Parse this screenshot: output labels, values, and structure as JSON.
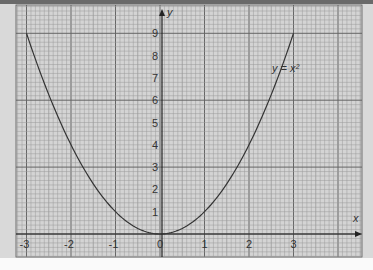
{
  "chart_data": {
    "type": "line",
    "title": "",
    "xlabel": "x",
    "ylabel": "y",
    "xlim": [
      -3.2,
      4.5
    ],
    "ylim": [
      -1,
      10
    ],
    "grid": true,
    "x_ticks": [
      "-3",
      "-2",
      "-1",
      "0",
      "1",
      "2",
      "3"
    ],
    "y_ticks": [
      "1",
      "2",
      "3",
      "4",
      "5",
      "6",
      "7",
      "8",
      "9"
    ],
    "series": [
      {
        "name": "y = x²",
        "x": [
          -3,
          -2.5,
          -2,
          -1.5,
          -1,
          -0.5,
          0,
          0.5,
          1,
          1.5,
          2,
          2.5,
          3
        ],
        "values": [
          9,
          6.25,
          4,
          2.25,
          1,
          0.25,
          0,
          0.25,
          1,
          2.25,
          4,
          6.25,
          9
        ]
      }
    ],
    "annotations": [
      {
        "text": "y = x²",
        "x": 3.1,
        "y": 7.5
      }
    ]
  },
  "labels": {
    "x_axis": "x",
    "y_axis": "y",
    "curve_label": "y = x²",
    "origin": "0"
  },
  "colors": {
    "grid_minor": "#9a9a9a",
    "grid_major": "#666666",
    "curve": "#333333",
    "paper": "#d4d4d4"
  }
}
